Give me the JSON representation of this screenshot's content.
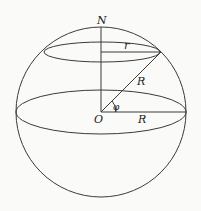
{
  "diagram": {
    "labels": {
      "north": "N",
      "small_radius": "r",
      "sphere_radius_slant": "R",
      "center": "O",
      "angle": "φ",
      "sphere_radius_equator": "R"
    },
    "geometry": {
      "center": [
        101,
        112
      ],
      "sphere_radius": 85,
      "equator": {
        "rx": 85,
        "ry": 22
      },
      "latitude_circle": {
        "cx": 102,
        "cy": 52,
        "rx": 58,
        "ry": 10
      },
      "latitude_point": [
        161,
        52
      ]
    },
    "colors": {
      "stroke": "#3a3a3a",
      "background": "#fafaf8"
    }
  }
}
